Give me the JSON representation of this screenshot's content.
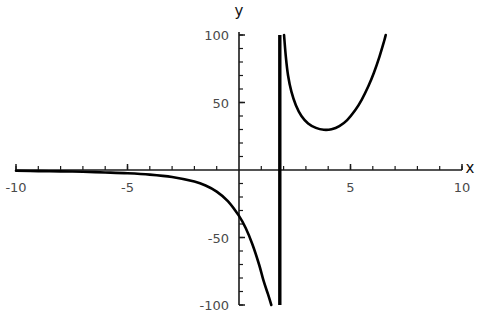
{
  "chart_data": {
    "type": "line",
    "title": "",
    "subtitle": "",
    "xlabel": "x",
    "ylabel": "y",
    "xlim": [
      -10,
      10
    ],
    "ylim": [
      -100,
      100
    ],
    "grid": false,
    "legend": null,
    "x_ticks_major": [
      -10,
      -5,
      5,
      10
    ],
    "x_tick_labels": [
      "-10",
      "-5",
      "5",
      "10"
    ],
    "y_ticks_major": [
      -100,
      -50,
      50,
      100
    ],
    "y_tick_labels": [
      "-100",
      "-50",
      "50",
      "100"
    ],
    "x_minor_step": 1,
    "y_minor_step": 10,
    "asymptotes": {
      "vertical": [
        1.83
      ]
    },
    "series": [
      {
        "name": "left-branch",
        "comment": "approaches 0 from below as x -> -10, plunges to -100 near the asymptote",
        "points": [
          [
            -10.0,
            -0.6
          ],
          [
            -9.0,
            -0.8
          ],
          [
            -8.0,
            -1.0
          ],
          [
            -7.0,
            -1.3
          ],
          [
            -6.0,
            -1.8
          ],
          [
            -5.0,
            -2.4
          ],
          [
            -4.0,
            -3.4
          ],
          [
            -3.0,
            -5.2
          ],
          [
            -2.0,
            -8.6
          ],
          [
            -1.5,
            -11.5
          ],
          [
            -1.0,
            -16.0
          ],
          [
            -0.5,
            -23.0
          ],
          [
            0.0,
            -34.0
          ],
          [
            0.3,
            -43.0
          ],
          [
            0.6,
            -55.0
          ],
          [
            0.9,
            -70.0
          ],
          [
            1.1,
            -82.0
          ],
          [
            1.3,
            -92.0
          ],
          [
            1.45,
            -100.0
          ]
        ]
      },
      {
        "name": "right-branch",
        "comment": "descends from +100 at the asymptote to a minimum near (4.5, 30) then rises to +100",
        "points": [
          [
            2.02,
            100.0
          ],
          [
            2.1,
            84.0
          ],
          [
            2.2,
            70.0
          ],
          [
            2.35,
            58.0
          ],
          [
            2.55,
            48.0
          ],
          [
            2.8,
            40.0
          ],
          [
            3.1,
            34.5
          ],
          [
            3.45,
            31.2
          ],
          [
            3.8,
            29.8
          ],
          [
            4.15,
            30.2
          ],
          [
            4.5,
            32.5
          ],
          [
            4.85,
            37.0
          ],
          [
            5.2,
            44.0
          ],
          [
            5.5,
            52.0
          ],
          [
            5.8,
            62.0
          ],
          [
            6.05,
            72.0
          ],
          [
            6.3,
            84.0
          ],
          [
            6.5,
            95.0
          ],
          [
            6.58,
            100.0
          ]
        ]
      }
    ]
  },
  "axes": {
    "x_axis_name": "x",
    "y_axis_name": "y"
  }
}
